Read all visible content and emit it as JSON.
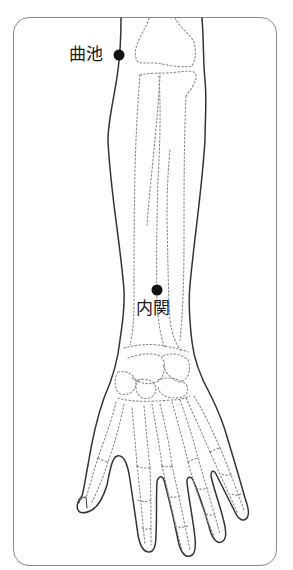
{
  "diagram": {
    "colors": {
      "outline": "#333333",
      "bone_dotted": "#8a8a8a",
      "frame": "#8a8a8a",
      "point": "#111111",
      "label": "#1a1a1a"
    },
    "points": [
      {
        "id": "quchi",
        "label": "曲池",
        "x": 119,
        "y": 55,
        "label_x": 69,
        "label_y": 46
      },
      {
        "id": "neiguan",
        "label": "内関",
        "x": 157,
        "y": 290,
        "label_x": 136,
        "label_y": 300
      }
    ]
  }
}
